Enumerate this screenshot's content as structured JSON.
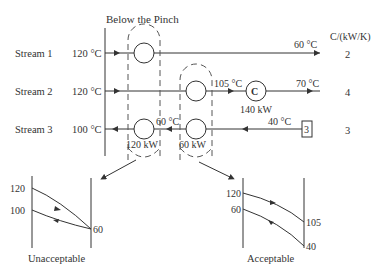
{
  "title": "Below the Pinch",
  "cp_header": "C/(kW/K)",
  "streams": [
    {
      "label": "Stream 1",
      "supply": "120 °C",
      "target": "60 °C",
      "cp": "2"
    },
    {
      "label": "Stream 2",
      "supply": "120 °C",
      "intermediate": "105 °C",
      "target": "70 °C",
      "cp": "4",
      "cooler_label": "C",
      "cooler_duty": "140 kW"
    },
    {
      "label": "Stream 3",
      "supply": "40 °C",
      "intermediate": "60 °C",
      "target": "100 °C",
      "cp": "3",
      "source_box": "3"
    }
  ],
  "exchangers": [
    {
      "duty": "120 kW"
    },
    {
      "duty": "60 kW"
    }
  ],
  "plots": [
    {
      "caption": "Unacceptable",
      "hot_in": "120",
      "cold_out": "100",
      "end": "60"
    },
    {
      "caption": "Acceptable",
      "hot_in": "120",
      "cold_out": "60",
      "hot_out": "105",
      "cold_in": "40"
    }
  ]
}
